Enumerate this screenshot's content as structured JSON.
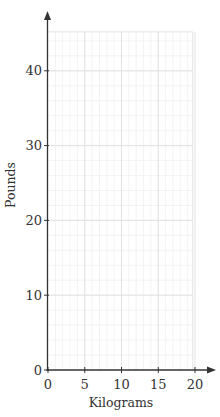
{
  "chart_data": {
    "type": "line",
    "title": "",
    "xlabel": "Kilograms",
    "ylabel": "Pounds",
    "xlim": [
      0,
      20
    ],
    "ylim": [
      0,
      45
    ],
    "x_ticks": [
      0,
      5,
      10,
      15,
      20
    ],
    "y_ticks": [
      0,
      10,
      20,
      30,
      40
    ],
    "x_tick_labels": [
      "0",
      "5",
      "10",
      "15",
      "20"
    ],
    "y_tick_labels": [
      "0",
      "10",
      "20",
      "30",
      "40"
    ],
    "grid": true,
    "grid_minor_x_step": 1,
    "grid_minor_y_step": 2,
    "series": [],
    "legend": null
  },
  "colors": {
    "axis": "#333333",
    "grid_major": "#e2e2e2",
    "grid_minor": "#f0f0f0",
    "text": "#333333"
  },
  "layout": {
    "x0_px": 48,
    "y0_px": 370,
    "px_per_x_unit": 7.35,
    "px_per_y_unit": 7.48,
    "grid_x_max": 19.7,
    "grid_y_max": 45.2
  }
}
